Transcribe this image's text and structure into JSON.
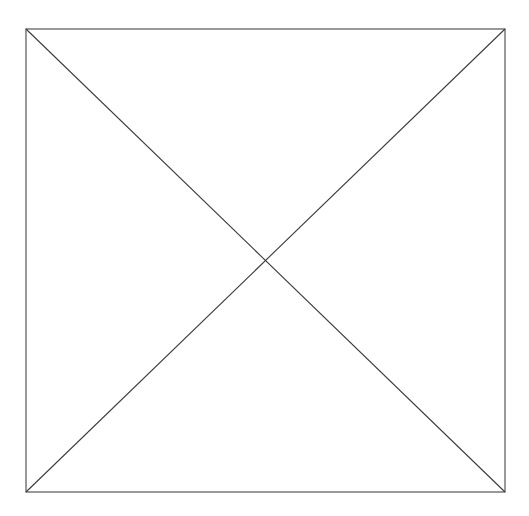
{
  "canvas": {
    "width": 529,
    "height": 516,
    "background_color": "#ffffff"
  },
  "placeholder": {
    "alt_text": "",
    "frame": {
      "x": 26,
      "y": 29,
      "width": 479,
      "height": 463,
      "stroke_color": "#555555",
      "stroke_width": 1.2,
      "fill_color": "#ffffff"
    },
    "diagonals": {
      "stroke_color": "#3a3a3a",
      "stroke_width": 1.1,
      "intersection_x": 265,
      "intersection_y": 261,
      "lines": [
        {
          "name": "diagonal-top-left-to-bottom-right",
          "x1": 26,
          "y1": 29,
          "x2": 505,
          "y2": 492
        },
        {
          "name": "diagonal-bottom-left-to-top-right",
          "x1": 26,
          "y1": 492,
          "x2": 505,
          "y2": 29
        }
      ]
    }
  }
}
